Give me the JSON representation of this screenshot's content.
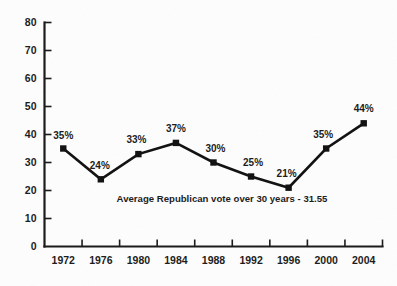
{
  "chart_data": {
    "type": "line",
    "title": "",
    "subtitle": "",
    "xlabel": "",
    "ylabel": "",
    "categories": [
      "1972",
      "1976",
      "1980",
      "1984",
      "1988",
      "1992",
      "1996",
      "2000",
      "2004"
    ],
    "values": [
      35,
      24,
      33,
      37,
      30,
      25,
      21,
      35,
      44
    ],
    "point_labels": [
      "35%",
      "24%",
      "33%",
      "37%",
      "30%",
      "25%",
      "21%",
      "35%",
      "44%"
    ],
    "ylim": [
      0,
      80
    ],
    "yticks": [
      0,
      10,
      20,
      30,
      40,
      50,
      60,
      70,
      80
    ],
    "ytick_labels": [
      "0",
      "10",
      "20",
      "30",
      "40",
      "50",
      "60",
      "70",
      "80"
    ],
    "grid": false,
    "legend": null,
    "legend_position": "none",
    "marker": "square",
    "line_color": "#111111",
    "marker_color": "#111111",
    "axis_color": "#1a1a1a",
    "annotations": [
      {
        "text": "Average Republican vote over 30 years - 31.55",
        "x_value": 1990,
        "y_value": 20.5
      }
    ]
  },
  "annotation": {
    "average_note": "Average Republican vote over 30 years - 31.55"
  }
}
